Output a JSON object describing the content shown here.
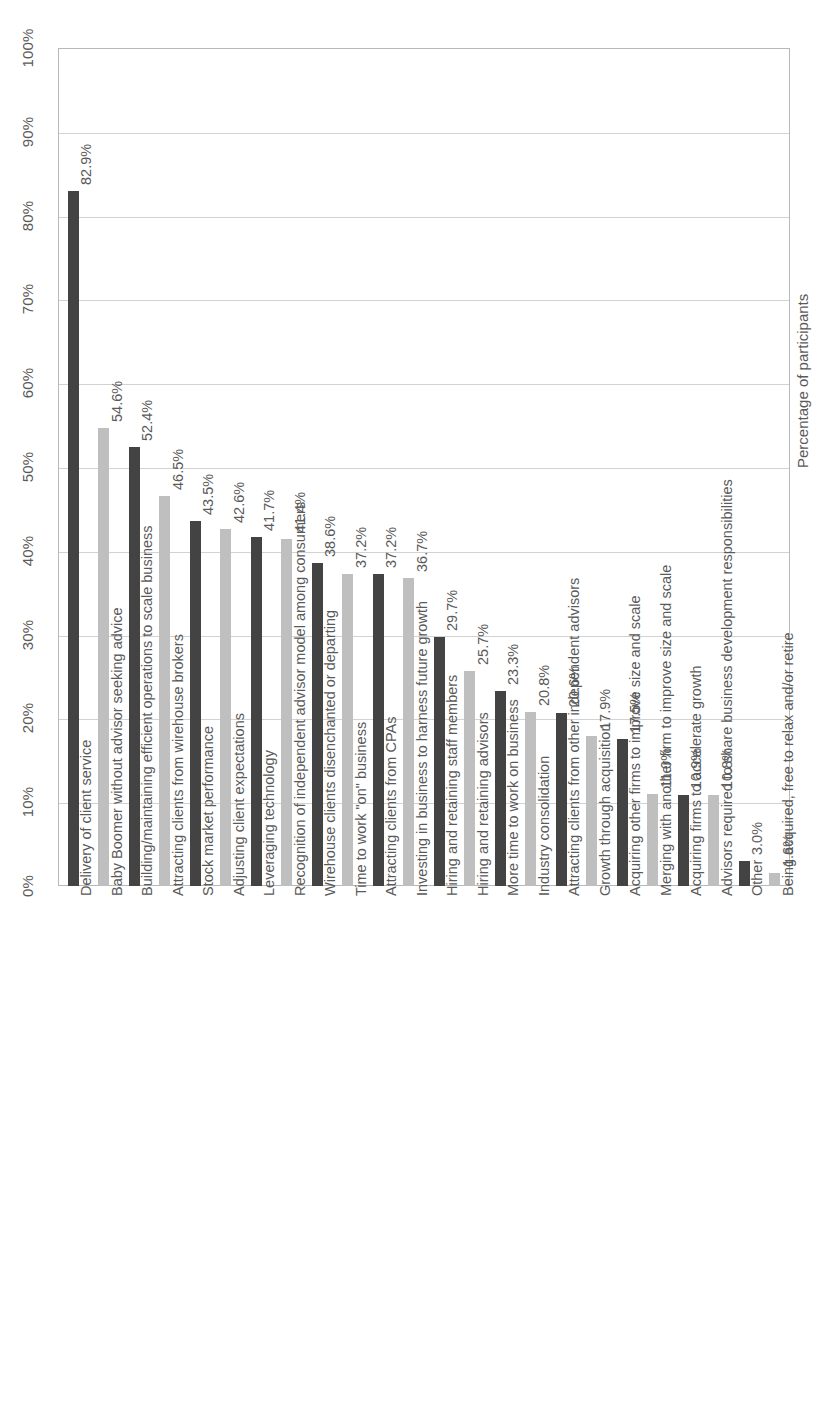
{
  "chart_data": {
    "type": "bar",
    "title": "",
    "subtitle": "",
    "xlabel": "",
    "ylabel": "Percentage of participants",
    "ylim": [
      0,
      100
    ],
    "grid": true,
    "legend": null,
    "orientation": "vertical-bars-rotated-90",
    "axis_tick_labels": [
      "0%",
      "10%",
      "20%",
      "30%",
      "40%",
      "50%",
      "60%",
      "70%",
      "80%",
      "90%",
      "100%"
    ],
    "axis_tick_values": [
      0,
      10,
      20,
      30,
      40,
      50,
      60,
      70,
      80,
      90,
      100
    ],
    "colors": {
      "dark": "#434343",
      "light": "#bfbfbf",
      "gridline": "#d2d2d2",
      "frame": "#b8b8b8",
      "text": "#5a5a5a"
    },
    "categories": [
      "Delivery of client service",
      "Baby Boomer without advisor seeking advice",
      "Building/maintaining efficient operations to scale business",
      "Attracting clients from wirehouse brokers",
      "Stock market performance",
      "Adjusting client expectations",
      "Leveraging technology",
      "Recognition of independent advisor model among consumers",
      "Wirehouse clients disenchanted or departing",
      "Time to work \"on\" business",
      "Attracting clients from CPAs",
      "Investing in business to harness future growth",
      "Hiring and retaining staff members",
      "Hiring and retaining advisors",
      "More time to work on business",
      "Industry consolidation",
      "Attracting clients from other independent advisors",
      "Growth through acquisition",
      "Acquiring other firms to improve size and scale",
      "Merging with another firm to improve size and scale",
      "Acquiring firms to accelerate growth",
      "Advisors required to share business development responsibilities",
      "Other",
      "Being acquired, free to relax and/or retire"
    ],
    "values": [
      82.9,
      54.6,
      52.4,
      46.5,
      43.5,
      42.6,
      41.7,
      41.4,
      38.6,
      37.2,
      37.2,
      36.7,
      29.7,
      25.7,
      23.3,
      20.8,
      20.6,
      17.9,
      17.5,
      11.0,
      10.9,
      10.8,
      3.0,
      1.6
    ],
    "value_labels": [
      "82.9%",
      "54.6%",
      "52.4%",
      "46.5%",
      "43.5%",
      "42.6%",
      "41.7%",
      "41.4%",
      "38.6%",
      "37.2%",
      "37.2%",
      "36.7%",
      "29.7%",
      "25.7%",
      "23.3%",
      "20.8%",
      "20.6%",
      "17.9%",
      "17.5%",
      "11.0%",
      "10.9%",
      "10.8%",
      "3.0%",
      "1.6%"
    ],
    "bar_styles": [
      "dark",
      "light",
      "dark",
      "light",
      "dark",
      "light",
      "dark",
      "light",
      "dark",
      "light",
      "dark",
      "light",
      "dark",
      "light",
      "dark",
      "light",
      "dark",
      "light",
      "dark",
      "light",
      "dark",
      "light",
      "dark",
      "light"
    ]
  }
}
